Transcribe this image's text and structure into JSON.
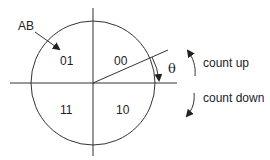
{
  "diagram": {
    "title": "",
    "pointer_label": "AB",
    "quadrants": [
      {
        "position": "top-left",
        "code": "01"
      },
      {
        "position": "top-right",
        "code": "00"
      },
      {
        "position": "bottom-left",
        "code": "11"
      },
      {
        "position": "bottom-right",
        "code": "10"
      }
    ],
    "angle_symbol": "θ",
    "direction_labels": {
      "up": "count up",
      "down": "count down"
    },
    "colors": {
      "stroke": "#333333",
      "text": "#222222",
      "background": "#ffffff"
    }
  }
}
